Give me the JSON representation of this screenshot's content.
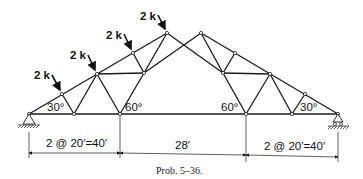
{
  "figure": {
    "caption": "Prob. 5–36.",
    "type": "symmetric roof truss with two peaks and a central bay"
  },
  "loads": [
    {
      "label": "2 k"
    },
    {
      "label": "2 k"
    },
    {
      "label": "2 k"
    },
    {
      "label": "2 k"
    }
  ],
  "angles": {
    "left_base": "30°",
    "left_inner": "60°",
    "right_inner": "60°",
    "right_base": "30°"
  },
  "dimensions": {
    "left_span": "2 @ 20′=40′",
    "center_span": "28′",
    "right_span": "2 @ 20′=40′"
  },
  "supports": {
    "left": "pin",
    "right": "roller"
  }
}
